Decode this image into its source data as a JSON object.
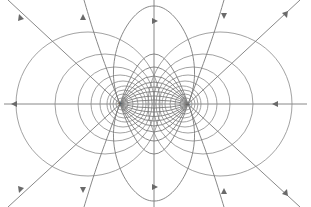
{
  "diagram": {
    "charges": [
      {
        "label": "+",
        "x": 120,
        "y": 104,
        "sign": "positive"
      },
      {
        "label": "−",
        "x": 188,
        "y": 104,
        "sign": "negative"
      }
    ],
    "colors": {
      "background": "#ffffff",
      "field_line": "#7a7a7a",
      "equipotential": "#8a8a8a",
      "arrow": "#6a6a6a"
    },
    "midline_x": 154,
    "axis_y": 104
  }
}
